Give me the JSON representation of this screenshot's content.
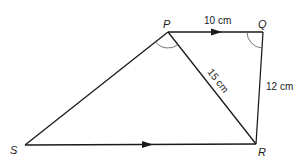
{
  "diagram": {
    "type": "quadrilateral",
    "vertices": {
      "P": {
        "label": "P",
        "x": 168,
        "y": 32
      },
      "Q": {
        "label": "Q",
        "x": 263,
        "y": 32
      },
      "R": {
        "label": "R",
        "x": 256,
        "y": 144
      },
      "S": {
        "label": "S",
        "x": 25,
        "y": 145
      }
    },
    "edges": [
      {
        "from": "P",
        "to": "Q",
        "label": "10 cm",
        "parallel_arrow": true
      },
      {
        "from": "Q",
        "to": "R",
        "label": "12 cm",
        "parallel_arrow": false
      },
      {
        "from": "P",
        "to": "R",
        "label": "15 cm",
        "parallel_arrow": false
      },
      {
        "from": "S",
        "to": "R",
        "label": "",
        "parallel_arrow": true
      },
      {
        "from": "S",
        "to": "P",
        "label": "",
        "parallel_arrow": false
      }
    ],
    "angle_marks": [
      "SPR",
      "PQR"
    ],
    "labels": {
      "P": "P",
      "Q": "Q",
      "R": "R",
      "S": "S",
      "PQ": "10 cm",
      "PR": "15 cm",
      "QR": "12 cm"
    },
    "colors": {
      "line": "#1a1a1a",
      "arc": "#555555",
      "background": "#ffffff"
    }
  }
}
